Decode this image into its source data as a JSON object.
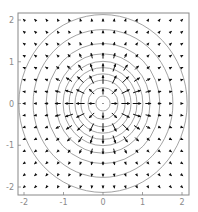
{
  "chart_data": {
    "type": "quiver-contour",
    "title": "",
    "xlabel": "",
    "ylabel": "",
    "xlim": [
      -2.15,
      2.15
    ],
    "ylim": [
      -2.15,
      2.15
    ],
    "grid": false,
    "legend": null,
    "x_ticks": [
      -2,
      -1,
      0,
      1,
      2
    ],
    "y_ticks": [
      -2,
      -1,
      0,
      1,
      2
    ],
    "x_tick_labels": [
      "-2",
      "-1",
      "0",
      "1",
      "2"
    ],
    "y_tick_labels": [
      "-2",
      "-1",
      "0",
      "1",
      "2"
    ],
    "quiver": {
      "grid_min": -2,
      "grid_max": 2,
      "grid_n": 15,
      "direction": "radially outward from origin",
      "magnitude_peak_radius": 0.7,
      "color": "#111111"
    },
    "contours": {
      "shape": "concentric circles centered at origin",
      "radii": [
        0.18,
        0.38,
        0.56,
        0.71,
        0.86,
        1.01,
        1.19,
        1.44,
        1.77,
        2.13
      ],
      "color": "#8c8c8c"
    }
  },
  "axes": {
    "frame_color": "#888888",
    "x_tick_labels": [
      "-2",
      "-1",
      "0",
      "1",
      "2"
    ],
    "y_tick_labels": [
      "2",
      "1",
      "0",
      "-1",
      "-2"
    ]
  }
}
